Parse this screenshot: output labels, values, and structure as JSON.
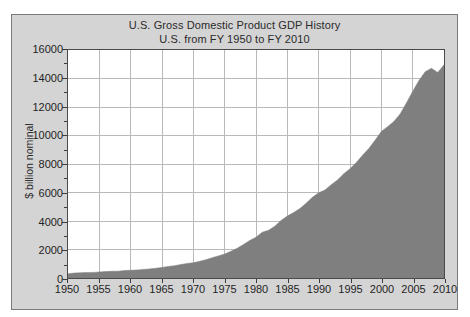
{
  "chart_data": {
    "type": "area",
    "title": "U.S. Gross Domestic Product GDP History",
    "subtitle": "U.S. from FY 1950 to FY 2010",
    "xlabel": "",
    "ylabel": "$ billion nominal",
    "xlim": [
      1950,
      2010
    ],
    "ylim": [
      0,
      16000
    ],
    "grid": true,
    "legend": null,
    "y_ticks": [
      0,
      2000,
      4000,
      6000,
      8000,
      10000,
      12000,
      14000,
      16000
    ],
    "y_minor_step": 1000,
    "x_ticks": [
      1950,
      1955,
      1960,
      1965,
      1970,
      1975,
      1980,
      1985,
      1990,
      1995,
      2000,
      2005,
      2010
    ],
    "series_name": "GDP",
    "x": [
      1950,
      1951,
      1952,
      1953,
      1954,
      1955,
      1956,
      1957,
      1958,
      1959,
      1960,
      1961,
      1962,
      1963,
      1964,
      1965,
      1966,
      1967,
      1968,
      1969,
      1970,
      1971,
      1972,
      1973,
      1974,
      1975,
      1976,
      1977,
      1978,
      1979,
      1980,
      1981,
      1982,
      1983,
      1984,
      1985,
      1986,
      1987,
      1988,
      1989,
      1990,
      1991,
      1992,
      1993,
      1994,
      1995,
      1996,
      1997,
      1998,
      1999,
      2000,
      2001,
      2002,
      2003,
      2004,
      2005,
      2006,
      2007,
      2008,
      2009,
      2010
    ],
    "values": [
      300,
      347,
      367,
      389,
      391,
      426,
      450,
      474,
      482,
      522,
      543,
      563,
      605,
      638,
      685,
      743,
      815,
      862,
      943,
      1020,
      1075,
      1167,
      1282,
      1428,
      1549,
      1689,
      1878,
      2086,
      2357,
      2632,
      2863,
      3211,
      3345,
      3638,
      4041,
      4347,
      4590,
      4870,
      5253,
      5658,
      5980,
      6174,
      6539,
      6879,
      7309,
      7664,
      8100,
      8609,
      9089,
      9661,
      10285,
      10622,
      10978,
      11511,
      12275,
      13094,
      13856,
      14478,
      14719,
      14419,
      14958
    ],
    "colors": {
      "fill": "#7f7f7f",
      "plot_background": "#ffffff",
      "frame_background": "#d4d4d4",
      "grid": "#b9b9b9",
      "axis": "#3c3c3c",
      "text": "#1f1f1f"
    }
  },
  "chart": {
    "title_line1": "U.S. Gross Domestic Product GDP History",
    "title_line2": "U.S. from FY 1950 to FY 2010",
    "ylabel": "$ billion nominal"
  }
}
